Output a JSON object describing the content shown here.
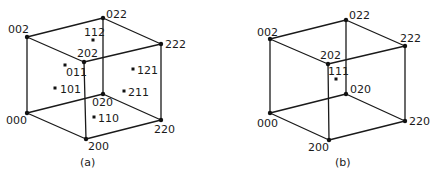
{
  "figure": {
    "panels": [
      {
        "caption": "(a)",
        "vertices": {
          "v000": {
            "label": "000",
            "x": 27,
            "y": 113
          },
          "v200": {
            "label": "200",
            "x": 86,
            "y": 139
          },
          "v020": {
            "label": "020",
            "x": 103,
            "y": 94
          },
          "v220": {
            "label": "220",
            "x": 161,
            "y": 120
          },
          "v002": {
            "label": "002",
            "x": 27,
            "y": 37
          },
          "v202": {
            "label": "202",
            "x": 84,
            "y": 62
          },
          "v022": {
            "label": "022",
            "x": 103,
            "y": 18
          },
          "v222": {
            "label": "222",
            "x": 161,
            "y": 44
          }
        },
        "interior_points": [
          {
            "label": "112",
            "x": 93,
            "y": 40
          },
          {
            "label": "011",
            "x": 65,
            "y": 65
          },
          {
            "label": "101",
            "x": 55,
            "y": 88
          },
          {
            "label": "121",
            "x": 133,
            "y": 69
          },
          {
            "label": "211",
            "x": 124,
            "y": 91
          },
          {
            "label": "110",
            "x": 94,
            "y": 117
          }
        ]
      },
      {
        "caption": "(b)",
        "vertices": {
          "v000": {
            "label": "000",
            "x": 270,
            "y": 113
          },
          "v200": {
            "label": "200",
            "x": 329,
            "y": 140
          },
          "v020": {
            "label": "020",
            "x": 346,
            "y": 94
          },
          "v220": {
            "label": "220",
            "x": 405,
            "y": 121
          },
          "v002": {
            "label": "002",
            "x": 270,
            "y": 39
          },
          "v202": {
            "label": "202",
            "x": 328,
            "y": 64
          },
          "v022": {
            "label": "022",
            "x": 346,
            "y": 20
          },
          "v222": {
            "label": "222",
            "x": 405,
            "y": 46
          }
        },
        "interior_points": [
          {
            "label": "111",
            "x": 336,
            "y": 79
          }
        ]
      }
    ]
  }
}
